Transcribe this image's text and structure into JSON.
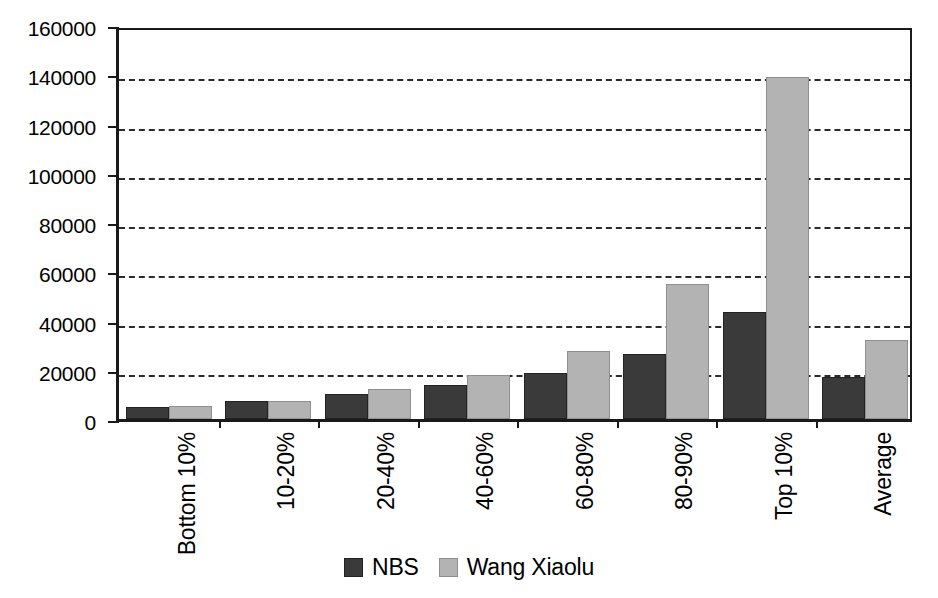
{
  "chart_data": {
    "type": "bar",
    "title": "",
    "xlabel": "",
    "ylabel": "",
    "ylim": [
      0,
      160000
    ],
    "ytick_step": 20000,
    "yticks": [
      "0",
      "20000",
      "40000",
      "60000",
      "80000",
      "100000",
      "120000",
      "140000",
      "160000"
    ],
    "grid": true,
    "grid_axis": "y",
    "grid_style": "dashed",
    "legend_position": "bottom-center",
    "categories": [
      "Bottom 10%",
      "10-20%",
      "20-40%",
      "40-60%",
      "60-80%",
      "80-90%",
      "Top 10%",
      "Average"
    ],
    "series": [
      {
        "name": "NBS",
        "color": "#3a3a3a",
        "values": [
          4900,
          7300,
          10100,
          13800,
          18800,
          26300,
          43500,
          17100
        ]
      },
      {
        "name": "Wang Xiaolu",
        "color": "#b3b3b3",
        "values": [
          5100,
          7500,
          12000,
          17900,
          27500,
          55000,
          139000,
          32000
        ]
      }
    ]
  },
  "legend": {
    "items": [
      {
        "label": "NBS",
        "swatch": "nbs"
      },
      {
        "label": "Wang Xiaolu",
        "swatch": "wx"
      }
    ]
  },
  "colors": {
    "nbs": "#3a3a3a",
    "wang_xiaolu": "#b3b3b3",
    "axis": "#1a1a1a",
    "grid": "#2b2b2b",
    "background": "#ffffff"
  }
}
